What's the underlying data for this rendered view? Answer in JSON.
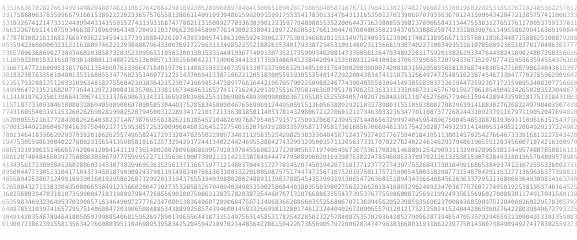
{
  "page": {
    "width_px": 577,
    "height_px": 240,
    "background_color": "#fefefe",
    "text_color": "#8d8d8d",
    "font_size_px": 6.1,
    "line_height_px": 7.45,
    "columns": 170,
    "rows": 30,
    "character_set": "0123456789"
  },
  "grid": {
    "rows": [
      "83526636702827663499349829488748331061764208429016923052899608978404130065109028179805040587107671179041130217482796682353001960220253185376718",
      "33175868063783599667916015389222202336575765581386611409199394861599209159917553341783013347643131653501270339069707933636781241590643428472138",
      "331832674121473312449994433415591527431393168747788211315089277033630390122359779480885535220064437162380855398237890658423344755383127651761",
      "26632367691141075034663871896996434872049110370662303458907761430023380411897226505317661304470760480350219437053388625074233188390761349558",
      "87787830021613682766970362234594117739168842261074393380574186310659243906237753093466820115334975240935123906174021389566713357601183634487",
      "05359423660900323121161809746221293048879643100369172266311349852255218826153401793387254531091480231156681930740227100349352161078560923",
      "736578063686902738434602018587328352399561110503200130153314481936774091307352173590934620814733905612647034892263175920138261933",
      "1110503200153216187030148801134887255136005713391560042217149063441931735934860412384420941135089312441091637",
      "13667147721600953381760113546607613306471840197361140831933240735913307137506612934851031764",
      "28183238763350104801353168055347760235146077322314370694133871062212",
      "5235179328817512033109634818375560423918364215230741",
      "1499964723352168207736441397230084163570613381",
      "411410197623501396641",
      "1157187731093",
      "7743168554031",
      "1620005552163",
      "670013449218",
      "78013464183",
      "1947530559863",
      "9865321930615",
      "986120748484",
      "4134356172309",
      "89500447733051",
      "40568942538671",
      "5265804327133",
      "360256803947",
      "653598346932",
      "648878531039",
      "304914203546",
      "019007238623"
    ]
  },
  "generation": {
    "mode": "pseudo-random-digits",
    "columns_per_row": 170,
    "total_rows": 30,
    "seed": 20250617
  }
}
